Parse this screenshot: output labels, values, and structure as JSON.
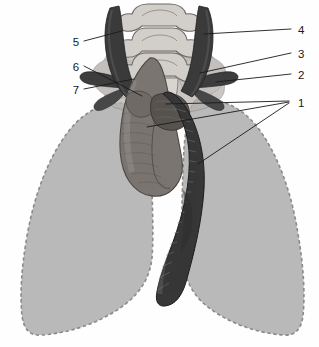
{
  "figure": {
    "type": "anatomical-line-diagram",
    "width": 319,
    "height": 347,
    "background_color": "#fefefe"
  },
  "palette": {
    "background": "#fefefe",
    "lung_fill": "#b9b9b9",
    "lung_outline": "#8f8f8f",
    "vertebra_fill": "#cfccc8",
    "vertebra_outline": "#6e6a66",
    "mediastinum_fill": "#bab6b2",
    "vessel_dark": "#3a3a3a",
    "vessel_mid": "#7a7570",
    "vessel_light": "#a09b96",
    "leader_line": "#1a1a1a",
    "label_text": "#1a1a1a"
  },
  "labels": [
    {
      "id": "label-1",
      "text": "1",
      "x": 298,
      "y": 104,
      "side": "right"
    },
    {
      "id": "label-2",
      "text": "2",
      "x": 298,
      "y": 76,
      "side": "right"
    },
    {
      "id": "label-3",
      "text": "3",
      "x": 298,
      "y": 55,
      "side": "right"
    },
    {
      "id": "label-4",
      "text": "4",
      "x": 298,
      "y": 31,
      "side": "right"
    },
    {
      "id": "label-5",
      "text": "5",
      "x": 76,
      "y": 43,
      "side": "left"
    },
    {
      "id": "label-6",
      "text": "6",
      "x": 76,
      "y": 68,
      "side": "left"
    },
    {
      "id": "label-7",
      "text": "7",
      "x": 76,
      "y": 91,
      "side": "left"
    }
  ],
  "leader_lines": [
    {
      "id": "leader-1a",
      "label": "1",
      "x1": 289,
      "y1": 101,
      "x2": 166,
      "y2": 104
    },
    {
      "id": "leader-1b",
      "label": "1",
      "x1": 289,
      "y1": 102,
      "x2": 147,
      "y2": 127
    },
    {
      "id": "leader-1c",
      "label": "1",
      "x1": 289,
      "y1": 103,
      "x2": 198,
      "y2": 164
    },
    {
      "id": "leader-2",
      "label": "2",
      "x1": 291,
      "y1": 74,
      "x2": 216,
      "y2": 82
    },
    {
      "id": "leader-3",
      "label": "3",
      "x1": 291,
      "y1": 53,
      "x2": 200,
      "y2": 73
    },
    {
      "id": "leader-4",
      "label": "4",
      "x1": 291,
      "y1": 29,
      "x2": 204,
      "y2": 34
    },
    {
      "id": "leader-5",
      "label": "5",
      "x1": 84,
      "y1": 41,
      "x2": 122,
      "y2": 31
    },
    {
      "id": "leader-6",
      "label": "6",
      "x1": 84,
      "y1": 66,
      "x2": 142,
      "y2": 96
    },
    {
      "id": "leader-7",
      "label": "7",
      "x1": 84,
      "y1": 89,
      "x2": 134,
      "y2": 79
    }
  ],
  "structures": [
    {
      "id": "lung-right",
      "name": "right-lung-silhouette",
      "fill": "#b9b9b9",
      "outline_style": "dashed"
    },
    {
      "id": "lung-left",
      "name": "left-lung-silhouette",
      "fill": "#b9b9b9",
      "outline_style": "dashed"
    },
    {
      "id": "vertebrae",
      "name": "vertebral-column",
      "count": 3,
      "fill": "#cfccc8"
    },
    {
      "id": "carotid-right",
      "name": "right-common-carotid-artery",
      "fill": "#3a3a3a"
    },
    {
      "id": "carotid-left",
      "name": "left-common-carotid-artery",
      "fill": "#3a3a3a"
    },
    {
      "id": "aortic-arch",
      "name": "aortic-arch",
      "fill": "#7a7570"
    },
    {
      "id": "descending-aorta",
      "name": "descending-aorta",
      "fill": "#3a3a3a"
    },
    {
      "id": "subclavian-right",
      "name": "right-subclavian-vessel",
      "fill": "#3a3a3a"
    },
    {
      "id": "subclavian-left",
      "name": "left-subclavian-vessel",
      "fill": "#3a3a3a"
    },
    {
      "id": "mediastinum",
      "name": "mediastinal-soft-tissue",
      "fill": "#bab6b2"
    }
  ]
}
